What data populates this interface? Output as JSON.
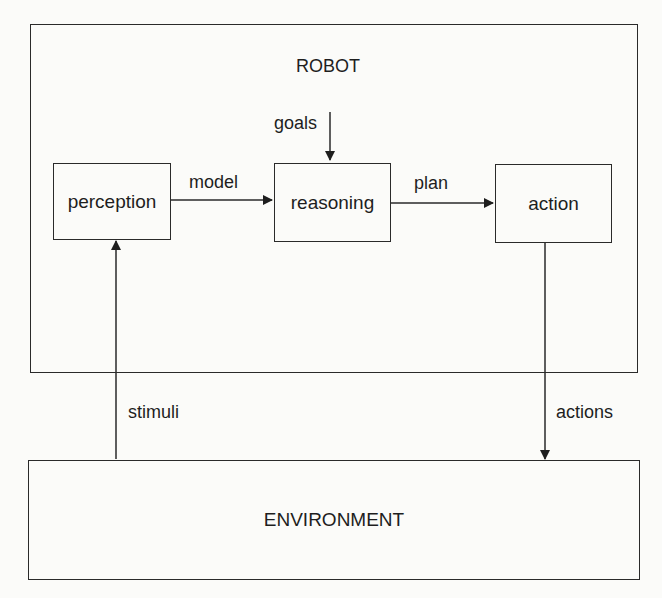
{
  "diagram": {
    "container": {
      "label": "ROBOT"
    },
    "nodes": [
      {
        "id": "perception",
        "label": "perception"
      },
      {
        "id": "reasoning",
        "label": "reasoning"
      },
      {
        "id": "action",
        "label": "action"
      },
      {
        "id": "environment",
        "label": "ENVIRONMENT"
      }
    ],
    "edges": [
      {
        "from": "external",
        "to": "reasoning",
        "label": "goals"
      },
      {
        "from": "perception",
        "to": "reasoning",
        "label": "model"
      },
      {
        "from": "reasoning",
        "to": "action",
        "label": "plan"
      },
      {
        "from": "action",
        "to": "environment",
        "label": "actions"
      },
      {
        "from": "environment",
        "to": "perception",
        "label": "stimuli"
      }
    ]
  }
}
